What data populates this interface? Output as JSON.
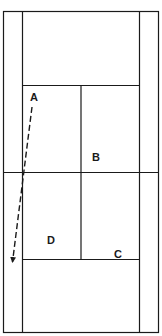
{
  "diagram": {
    "type": "tennis-court-top-view",
    "line_color": "#1a1a1a",
    "background": "#ffffff",
    "labels": [
      {
        "id": "A",
        "text": "A",
        "x": 33,
        "y": 101
      },
      {
        "id": "B",
        "text": "B",
        "x": 96,
        "y": 161
      },
      {
        "id": "C",
        "text": "C",
        "x": 118,
        "y": 258
      },
      {
        "id": "D",
        "text": "D",
        "x": 51,
        "y": 244
      }
    ],
    "path": {
      "style": "dashed-arrow",
      "from_label": "A",
      "start": [
        32,
        107
      ],
      "end": [
        12,
        262
      ]
    }
  }
}
